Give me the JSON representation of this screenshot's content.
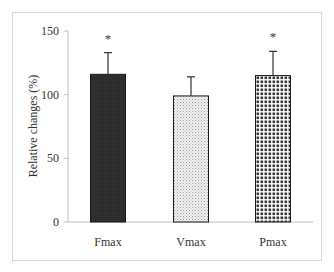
{
  "chart_data": {
    "type": "bar",
    "title": "",
    "xlabel": "",
    "ylabel": "Relative changes (%)",
    "ylim": [
      0,
      150
    ],
    "yticks": [
      0,
      50,
      100,
      150
    ],
    "grid": false,
    "legend": null,
    "categories": [
      "Fmax",
      "Vmax",
      "Pmax"
    ],
    "values": [
      116,
      99,
      115
    ],
    "error_upper": [
      133,
      114,
      134
    ],
    "significance": [
      "*",
      "",
      "*"
    ],
    "bar_styles": [
      "solid dark",
      "light dotted",
      "dark checkered dots"
    ]
  },
  "colors": {
    "bar_dark": "#2b2b2b",
    "bar_light_fill": "#e6e6e6",
    "axis": "#bfbfbf",
    "frame": "#d6d6d6",
    "text": "#333333"
  }
}
